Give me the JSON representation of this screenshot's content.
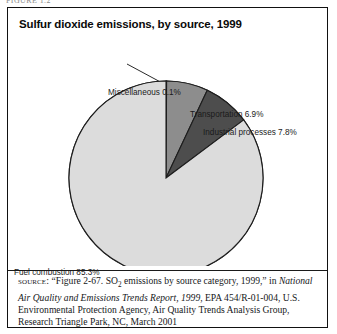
{
  "page": {
    "clipped_header": "FIGURE 1.2"
  },
  "figure": {
    "title": "Sulfur dioxide emissions, by source, 1999",
    "source_label": "source:",
    "source_text_1": "“Figure 2-67. SO",
    "source_sub": "2",
    "source_text_2": " emissions by source category, 1999,” in ",
    "source_italic": "National Air Quality and Emissions Trends Report, 1999",
    "source_text_3": ", EPA 454/R-01-004, U.S. Environmental Protection Agency, Air Quality Trends Analysis Group, Research Triangle Park, NC, March 2001"
  },
  "chart_data": {
    "type": "pie",
    "title": "Sulfur dioxide emissions, by source, 1999",
    "xlabel": "",
    "ylabel": "",
    "units": "percent",
    "start_angle_deg": 0,
    "direction": "clockwise",
    "legend": "none",
    "grid": false,
    "categories": [
      "Miscellaneous",
      "Transportation",
      "Industrial processes",
      "Fuel combustion"
    ],
    "values": [
      0.1,
      6.9,
      7.8,
      85.3
    ],
    "labels": [
      "Miscellaneous 0.1%",
      "Transportation 6.9%",
      "Industrial processes 7.8%",
      "Fuel combustion 85.3%"
    ],
    "colors": [
      "#d8d8d8",
      "#8d8d8d",
      "#4d4d4d",
      "#dcdcdc"
    ],
    "slice_outline": "#1d1d1d",
    "geometry": {
      "cx": 158,
      "cy": 140,
      "r": 97
    }
  }
}
